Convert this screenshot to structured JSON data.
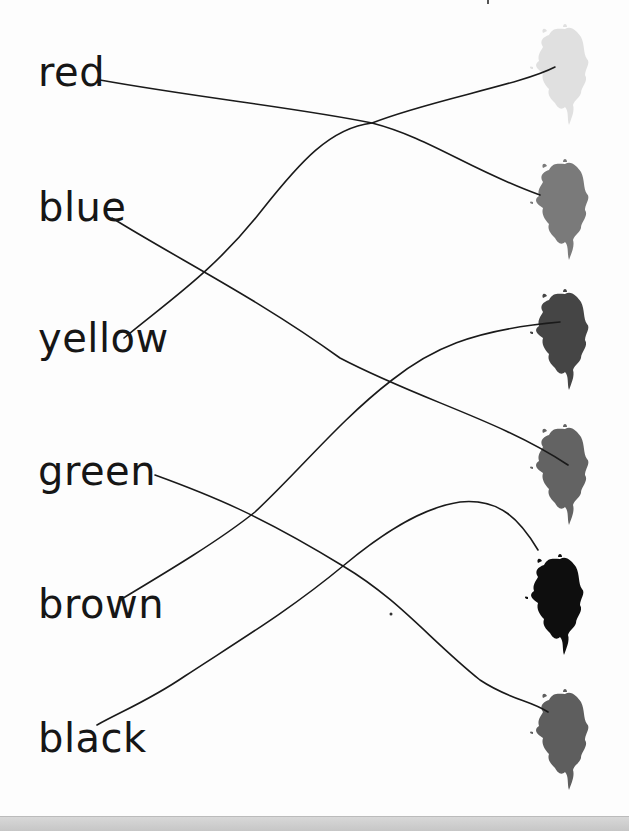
{
  "worksheet": {
    "type": "color-word matching exercise",
    "words": [
      {
        "label": "red",
        "y": 60
      },
      {
        "label": "blue",
        "y": 195
      },
      {
        "label": "yellow",
        "y": 326
      },
      {
        "label": "green",
        "y": 461
      },
      {
        "label": "brown",
        "y": 592
      },
      {
        "label": "black",
        "y": 727
      }
    ],
    "splats": [
      {
        "index": 1,
        "cx": 563,
        "cy": 65,
        "fill": "#e0e0e0"
      },
      {
        "index": 2,
        "cx": 563,
        "cy": 200,
        "fill": "#7a7a7a"
      },
      {
        "index": 3,
        "cx": 563,
        "cy": 330,
        "fill": "#454545"
      },
      {
        "index": 4,
        "cx": 563,
        "cy": 465,
        "fill": "#636363"
      },
      {
        "index": 5,
        "cx": 558,
        "cy": 595,
        "fill": "#0e0e0e"
      },
      {
        "index": 6,
        "cx": 563,
        "cy": 730,
        "fill": "#5e5e5e"
      }
    ],
    "connections": [
      {
        "from": "red",
        "to_splat": 2
      },
      {
        "from": "blue",
        "to_splat": 4
      },
      {
        "from": "yellow",
        "to_splat": 1
      },
      {
        "from": "green",
        "to_splat": 6
      },
      {
        "from": "brown",
        "to_splat": 3
      },
      {
        "from": "black",
        "to_splat": 5
      }
    ],
    "line_color": "#1a1a1a"
  }
}
